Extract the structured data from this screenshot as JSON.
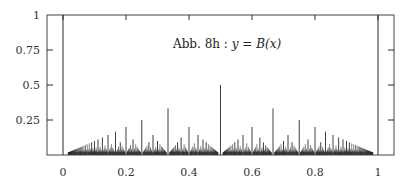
{
  "chart_data": {
    "type": "bar",
    "title": "Abb. 8h : y = B(x)",
    "title_parts": {
      "prefix": "Abb. 8h : ",
      "y": "y",
      "eq": " = ",
      "func": "B",
      "arg": "(x)"
    },
    "xlabel": "",
    "ylabel": "",
    "xlim": [
      -0.05,
      1.05
    ],
    "ylim": [
      0,
      1
    ],
    "x_ticks": [
      0,
      0.2,
      0.4,
      0.6,
      0.8,
      1
    ],
    "x_tick_labels": [
      "0",
      "0.2",
      "0.4",
      "0.6",
      "0.8",
      "1"
    ],
    "y_ticks": [
      0.25,
      0.5,
      0.75,
      1
    ],
    "y_tick_labels": [
      "0.25",
      "0.5",
      "0.75",
      "1"
    ],
    "grid": false,
    "legend": null,
    "rule": "B(p/q) = 1/q",
    "max_denominator": 60,
    "boundary_lines": [
      0,
      1
    ],
    "sample_points": [
      {
        "x": 0.5,
        "y": 0.5
      },
      {
        "x": 0.3333,
        "y": 0.3333
      },
      {
        "x": 0.6667,
        "y": 0.3333
      },
      {
        "x": 0.25,
        "y": 0.25
      },
      {
        "x": 0.75,
        "y": 0.25
      },
      {
        "x": 0.2,
        "y": 0.2
      },
      {
        "x": 0.4,
        "y": 0.2
      },
      {
        "x": 0.6,
        "y": 0.2
      },
      {
        "x": 0.8,
        "y": 0.2
      },
      {
        "x": 0.1667,
        "y": 0.1667
      },
      {
        "x": 0.8333,
        "y": 0.1667
      }
    ]
  },
  "colors": {
    "line": "#2a2a2a",
    "frame": "#444444",
    "text": "#222222"
  }
}
